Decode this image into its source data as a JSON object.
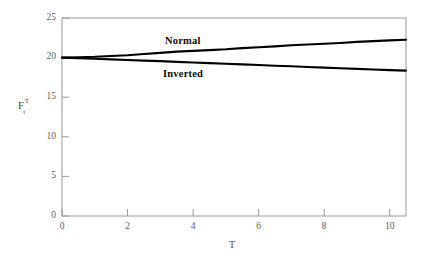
{
  "chart_data": {
    "type": "line",
    "title": "",
    "subtitle": "",
    "xlabel": "T",
    "ylabel": "F_t^T",
    "ylabel_parts": {
      "base": "F",
      "superscript": "T",
      "subscript": "t"
    },
    "xlim": [
      0,
      10.5
    ],
    "ylim": [
      0,
      25
    ],
    "xticks": [
      0,
      2,
      4,
      6,
      8,
      10
    ],
    "xtick_labels": [
      "0",
      "2",
      "4",
      "6",
      "8",
      "10"
    ],
    "yticks": [
      0,
      5,
      10,
      15,
      20,
      25
    ],
    "ytick_labels": [
      "0",
      "5",
      "10",
      "15",
      "20",
      "25"
    ],
    "grid": false,
    "legend_position": "inline-annotations",
    "frame": true,
    "tick_direction": "in",
    "line_color": "#000000",
    "axis_color": "#9a9a9a",
    "series": [
      {
        "name": "Normal",
        "label": "Normal",
        "x": [
          0.0,
          0.5,
          1.0,
          1.5,
          2.0,
          2.5,
          3.0,
          3.5,
          4.0,
          4.5,
          5.0,
          5.5,
          6.0,
          6.5,
          7.0,
          7.5,
          8.0,
          8.5,
          9.0,
          9.5,
          10.0,
          10.5
        ],
        "values": [
          20.0,
          20.05,
          20.1,
          20.2,
          20.3,
          20.45,
          20.6,
          20.75,
          20.85,
          20.95,
          21.05,
          21.2,
          21.3,
          21.42,
          21.55,
          21.65,
          21.75,
          21.85,
          21.98,
          22.08,
          22.18,
          22.25
        ]
      },
      {
        "name": "Inverted",
        "label": "Inverted",
        "x": [
          0.0,
          0.5,
          1.0,
          1.5,
          2.0,
          2.5,
          3.0,
          3.5,
          4.0,
          4.5,
          5.0,
          5.5,
          6.0,
          6.5,
          7.0,
          7.5,
          8.0,
          8.5,
          9.0,
          9.5,
          10.0,
          10.5
        ],
        "values": [
          20.0,
          19.92,
          19.85,
          19.78,
          19.7,
          19.62,
          19.55,
          19.46,
          19.38,
          19.3,
          19.22,
          19.14,
          19.06,
          18.98,
          18.9,
          18.82,
          18.74,
          18.66,
          18.58,
          18.5,
          18.42,
          18.36
        ]
      }
    ],
    "annotations": [
      {
        "text": "Normal",
        "x": 3.6,
        "y": 21.6
      },
      {
        "text": "Inverted",
        "x": 3.5,
        "y": 17.6
      }
    ]
  }
}
